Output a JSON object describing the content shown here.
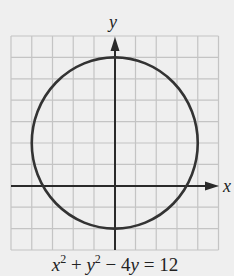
{
  "chart_data": {
    "type": "line",
    "title": "",
    "equation": "x^2 + y^2 - 4y = 12",
    "xlabel": "x",
    "ylabel": "y",
    "xlim": [
      -5,
      5
    ],
    "ylim": [
      -3,
      7
    ],
    "grid": true,
    "grid_step": 1,
    "curve": {
      "shape": "circle",
      "center": [
        0,
        2
      ],
      "radius": 4
    },
    "key_points": {
      "top": [
        0,
        6
      ],
      "bottom": [
        0,
        -2
      ],
      "left": [
        -4,
        2
      ],
      "right": [
        4,
        2
      ],
      "x_intercepts": [
        -3.46,
        3.46
      ]
    }
  },
  "labels": {
    "x_axis": "x",
    "y_axis": "y",
    "eq_x": "x",
    "eq_y": "y",
    "eq_y2": "y",
    "eq_exp": "2",
    "eq_plus": " + ",
    "eq_minus": " − 4",
    "eq_rhs": " = 12"
  },
  "colors": {
    "background": "#efefef",
    "grid": "#c4c4c4",
    "axis": "#2a2a2a",
    "curve": "#333333"
  }
}
